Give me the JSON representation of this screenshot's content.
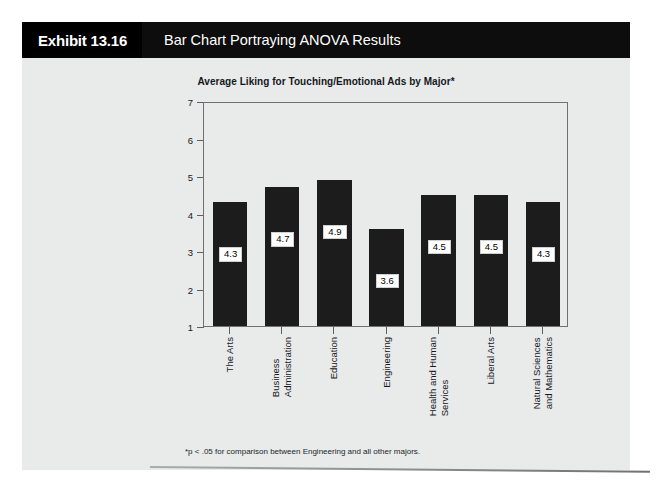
{
  "exhibit": {
    "number_label": "Exhibit 13.16",
    "title": "Bar Chart Portraying ANOVA Results"
  },
  "chart_data": {
    "type": "bar",
    "title": "Average Liking for Touching/Emotional Ads by Major*",
    "xlabel": "",
    "ylabel": "",
    "ylim": [
      1,
      7
    ],
    "yticks": [
      1,
      2,
      3,
      4,
      5,
      6,
      7
    ],
    "grid": false,
    "legend": "none",
    "bar_color": "#1c1c1c",
    "categories": [
      "The Arts",
      "Business Administration",
      "Education",
      "Engineering",
      "Health and Human Services",
      "Liberal Arts",
      "Natural Sciences and Mathematics"
    ],
    "category_lines": [
      [
        "The Arts"
      ],
      [
        "Business",
        "Administration"
      ],
      [
        "Education"
      ],
      [
        "Engineering"
      ],
      [
        "Health and Human",
        "Services"
      ],
      [
        "Liberal Arts"
      ],
      [
        "Natural Sciences",
        "and Mathematics"
      ]
    ],
    "values": [
      4.3,
      4.7,
      4.9,
      3.6,
      4.5,
      4.5,
      4.3
    ],
    "value_labels": [
      "4.3",
      "4.7",
      "4.9",
      "3.6",
      "4.5",
      "4.5",
      "4.3"
    ],
    "footnote": "*p < .05 for comparison between Engineering and all other majors."
  },
  "ticks": {
    "y": [
      "7",
      "6",
      "5",
      "4",
      "3",
      "2",
      "1"
    ]
  }
}
